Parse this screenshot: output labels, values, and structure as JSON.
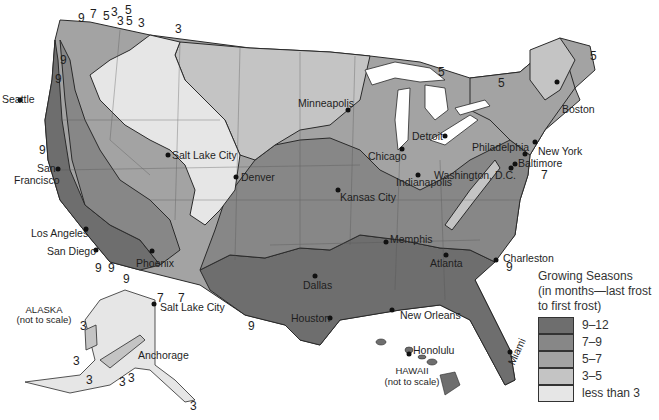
{
  "legend": {
    "title_lines": [
      "Growing Seasons",
      "(in months—last frost",
      "to first frost)"
    ],
    "items": [
      {
        "label": "9–12",
        "color": "#6e6e6e"
      },
      {
        "label": "7–9",
        "color": "#878787"
      },
      {
        "label": "5–7",
        "color": "#a3a3a3"
      },
      {
        "label": "3–5",
        "color": "#c4c4c4"
      },
      {
        "label": "less than 3",
        "color": "#e6e6e6"
      }
    ]
  },
  "cities": [
    {
      "name": "Seattle",
      "x": 24,
      "y": 100
    },
    {
      "name": "San",
      "x": 52,
      "y": 166
    },
    {
      "name": "Francisco",
      "x": 40,
      "y": 178
    },
    {
      "name": "Salt Lake City",
      "x": 172,
      "y": 156
    },
    {
      "name": "Denver",
      "x": 241,
      "y": 177
    },
    {
      "name": "Minneapolis",
      "x": 298,
      "y": 98
    },
    {
      "name": "Chicago",
      "x": 368,
      "y": 150
    },
    {
      "name": "Detroit",
      "x": 412,
      "y": 132
    },
    {
      "name": "Indianapolis",
      "x": 396,
      "y": 177
    },
    {
      "name": "Kansas City",
      "x": 340,
      "y": 192
    },
    {
      "name": "Boston",
      "x": 563,
      "y": 84
    },
    {
      "name": "New York",
      "x": 537,
      "y": 145
    },
    {
      "name": "Philadelphia",
      "x": 472,
      "y": 142
    },
    {
      "name": "Baltimore",
      "x": 518,
      "y": 159
    },
    {
      "name": "Washington, D.C.",
      "x": 434,
      "y": 171
    },
    {
      "name": "Los Angeles",
      "x": 31,
      "y": 228
    },
    {
      "name": "San Diego",
      "x": 47,
      "y": 245
    },
    {
      "name": "Phoenix",
      "x": 136,
      "y": 258
    },
    {
      "name": "Memphis",
      "x": 392,
      "y": 234
    },
    {
      "name": "Atlanta",
      "x": 430,
      "y": 258
    },
    {
      "name": "Charleston",
      "x": 503,
      "y": 253
    },
    {
      "name": "Dallas",
      "x": 302,
      "y": 280
    },
    {
      "name": "Houston",
      "x": 290,
      "y": 313
    },
    {
      "name": "New Orleans",
      "x": 400,
      "y": 310
    },
    {
      "name": "Honolulu",
      "x": 413,
      "y": 344
    },
    {
      "name": "Miami",
      "x": 508,
      "y": 372
    },
    {
      "name": "Salt Lake City",
      "x": 160,
      "y": 302
    },
    {
      "name": "Anchorage",
      "x": 138,
      "y": 350
    }
  ],
  "insets": {
    "alaska": {
      "title": "ALASKA",
      "note": "(not to scale)"
    },
    "hawaii": {
      "title": "HAWAII",
      "note": "(not to scale)"
    }
  },
  "contour_labels": [
    {
      "v": "9",
      "x": 78,
      "y": 12
    },
    {
      "v": "7",
      "x": 90,
      "y": 10
    },
    {
      "v": "5",
      "x": 103,
      "y": 10
    },
    {
      "v": "3",
      "x": 111,
      "y": 7
    },
    {
      "v": "5",
      "x": 125,
      "y": 5
    },
    {
      "v": "3",
      "x": 117,
      "y": 17
    },
    {
      "v": "5",
      "x": 126,
      "y": 17
    },
    {
      "v": "3",
      "x": 138,
      "y": 17
    },
    {
      "v": "3",
      "x": 175,
      "y": 25
    },
    {
      "v": "9",
      "x": 60,
      "y": 56
    },
    {
      "v": "9",
      "x": 55,
      "y": 75
    },
    {
      "v": "9",
      "x": 39,
      "y": 146
    },
    {
      "v": "9",
      "x": 95,
      "y": 262
    },
    {
      "v": "9",
      "x": 108,
      "y": 262
    },
    {
      "v": "9",
      "x": 123,
      "y": 275
    },
    {
      "v": "7",
      "x": 157,
      "y": 292
    },
    {
      "v": "7",
      "x": 178,
      "y": 292
    },
    {
      "v": "9",
      "x": 248,
      "y": 322
    },
    {
      "v": "5",
      "x": 438,
      "y": 66
    },
    {
      "v": "5",
      "x": 498,
      "y": 77
    },
    {
      "v": "5",
      "x": 590,
      "y": 50
    },
    {
      "v": "7",
      "x": 541,
      "y": 170
    },
    {
      "v": "9",
      "x": 506,
      "y": 262
    },
    {
      "v": "3",
      "x": 80,
      "y": 320
    },
    {
      "v": "3",
      "x": 73,
      "y": 355
    },
    {
      "v": "3",
      "x": 86,
      "y": 375
    },
    {
      "v": "3",
      "x": 119,
      "y": 377
    },
    {
      "v": "3",
      "x": 128,
      "y": 374
    },
    {
      "v": "3",
      "x": 190,
      "y": 400
    },
    {
      "v": "3",
      "x": 190,
      "y": 405
    }
  ]
}
